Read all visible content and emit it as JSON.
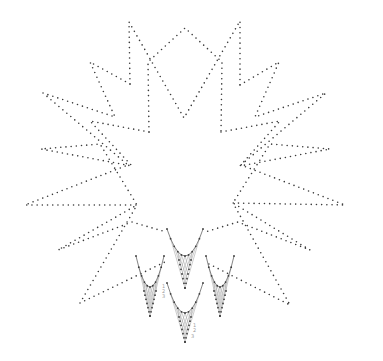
{
  "pattern": {
    "name": "string-art star pattern",
    "background": "#ffffff",
    "dot_color": "#3a3a3a",
    "thread_color": "#9a9a9a",
    "star_paths": [
      {
        "id": "top-outer",
        "points": [
          [
            130,
            84
          ],
          [
            129,
            22
          ],
          [
            184,
            118
          ],
          [
            240,
            21
          ],
          [
            240,
            85
          ]
        ]
      },
      {
        "id": "top-inner",
        "points": [
          [
            149,
            132
          ],
          [
            148,
            62
          ],
          [
            185,
            28
          ],
          [
            222,
            62
          ],
          [
            221,
            132
          ]
        ]
      },
      {
        "id": "left-outer",
        "points": [
          [
            130,
            84
          ],
          [
            90,
            62
          ],
          [
            115,
            117
          ],
          [
            43,
            93
          ],
          [
            128,
            165
          ],
          [
            25,
            205
          ],
          [
            137,
            205
          ],
          [
            80,
            303
          ],
          [
            165,
            262
          ]
        ]
      },
      {
        "id": "left-inner",
        "points": [
          [
            149,
            132
          ],
          [
            90,
            121
          ],
          [
            132,
            166
          ],
          [
            41,
            149
          ],
          [
            100,
            144
          ],
          [
            137,
            205
          ],
          [
            58,
            250
          ],
          [
            132,
            222
          ],
          [
            166,
            232
          ]
        ]
      },
      {
        "id": "right-outer",
        "points": [
          [
            240,
            85
          ],
          [
            279,
            62
          ],
          [
            255,
            117
          ],
          [
            326,
            93
          ],
          [
            241,
            165
          ],
          [
            345,
            205
          ],
          [
            233,
            203
          ],
          [
            290,
            305
          ],
          [
            205,
            262
          ]
        ]
      },
      {
        "id": "right-inner",
        "points": [
          [
            221,
            132
          ],
          [
            280,
            121
          ],
          [
            240,
            166
          ],
          [
            330,
            149
          ],
          [
            270,
            144
          ],
          [
            233,
            203
          ],
          [
            310,
            250
          ],
          [
            238,
            222
          ],
          [
            205,
            232
          ]
        ]
      }
    ],
    "motifs": [
      {
        "id": "motif-top",
        "cx": 185,
        "top": 229,
        "width": 36,
        "bottom": 288,
        "curve_y": 256
      },
      {
        "id": "motif-left",
        "cx": 150,
        "top": 256,
        "width": 28,
        "bottom": 316,
        "curve_y": 287
      },
      {
        "id": "motif-right",
        "cx": 220,
        "top": 256,
        "width": 28,
        "bottom": 316,
        "curve_y": 287
      },
      {
        "id": "motif-bottom",
        "cx": 185,
        "top": 283,
        "width": 36,
        "bottom": 342,
        "curve_y": 313
      }
    ],
    "labels": [
      {
        "text": "1",
        "x": 162,
        "y": 288
      },
      {
        "text": "2",
        "x": 162,
        "y": 293
      },
      {
        "text": "3",
        "x": 162,
        "y": 298
      },
      {
        "text": "1",
        "x": 193,
        "y": 327
      },
      {
        "text": "2",
        "x": 193,
        "y": 332
      },
      {
        "text": "3",
        "x": 191,
        "y": 338
      }
    ]
  }
}
